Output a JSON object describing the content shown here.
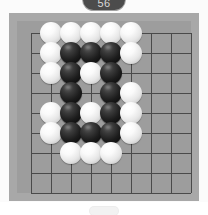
{
  "badge": {
    "label": "56",
    "color": "#4c4c4c",
    "text_color": "#d8d8d8"
  },
  "board": {
    "frame_color": "#a8a8a8",
    "surface_color": "#9d9d9d",
    "line_color": "#4a4a4a",
    "grid_columns": 9,
    "grid_rows": 9,
    "cell_size": 20,
    "origin_x": 14,
    "origin_y": 12,
    "star_points": [
      [
        4,
        4
      ]
    ],
    "stone_colors": {
      "black": "#111111",
      "white": "#f2f2f2"
    },
    "stones": [
      {
        "col": 1,
        "row": 0,
        "color": "white"
      },
      {
        "col": 2,
        "row": 0,
        "color": "white"
      },
      {
        "col": 3,
        "row": 0,
        "color": "white"
      },
      {
        "col": 4,
        "row": 0,
        "color": "white"
      },
      {
        "col": 5,
        "row": 0,
        "color": "white"
      },
      {
        "col": 1,
        "row": 1,
        "color": "white"
      },
      {
        "col": 2,
        "row": 1,
        "color": "black"
      },
      {
        "col": 3,
        "row": 1,
        "color": "black"
      },
      {
        "col": 4,
        "row": 1,
        "color": "black"
      },
      {
        "col": 5,
        "row": 1,
        "color": "white"
      },
      {
        "col": 1,
        "row": 2,
        "color": "white"
      },
      {
        "col": 2,
        "row": 2,
        "color": "black"
      },
      {
        "col": 3,
        "row": 2,
        "color": "white"
      },
      {
        "col": 4,
        "row": 2,
        "color": "black"
      },
      {
        "col": 2,
        "row": 3,
        "color": "black"
      },
      {
        "col": 4,
        "row": 3,
        "color": "black"
      },
      {
        "col": 5,
        "row": 3,
        "color": "white"
      },
      {
        "col": 1,
        "row": 4,
        "color": "white"
      },
      {
        "col": 2,
        "row": 4,
        "color": "black"
      },
      {
        "col": 3,
        "row": 4,
        "color": "white"
      },
      {
        "col": 4,
        "row": 4,
        "color": "black"
      },
      {
        "col": 5,
        "row": 4,
        "color": "white"
      },
      {
        "col": 1,
        "row": 5,
        "color": "white"
      },
      {
        "col": 2,
        "row": 5,
        "color": "black"
      },
      {
        "col": 3,
        "row": 5,
        "color": "black"
      },
      {
        "col": 4,
        "row": 5,
        "color": "black"
      },
      {
        "col": 5,
        "row": 5,
        "color": "white"
      },
      {
        "col": 2,
        "row": 6,
        "color": "white"
      },
      {
        "col": 3,
        "row": 6,
        "color": "white"
      },
      {
        "col": 4,
        "row": 6,
        "color": "white"
      }
    ]
  },
  "bottom": {
    "strip_color": "#ffffff"
  }
}
